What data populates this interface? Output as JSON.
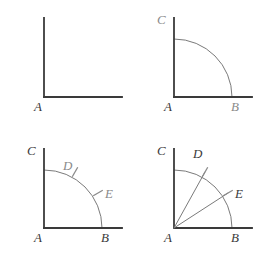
{
  "figure": {
    "type": "geometric-construction",
    "panel_count": 4,
    "layout": "2x2 grid",
    "colors": {
      "background": "#ffffff",
      "ray_stroke": "#3a3a3a",
      "arc_stroke": "#7a7a7a",
      "tick_stroke": "#8a8a8a",
      "label_dark": "#3a3a3a",
      "label_gray": "#8a8a8a"
    },
    "panels": [
      {
        "id": "panel-1",
        "step": 1,
        "description": "A right angle: one vertical ray and one horizontal ray meeting at vertex A",
        "vertex": {
          "name": "A",
          "x": 44,
          "y": 97
        },
        "labels": [
          {
            "name": "A",
            "text": "A",
            "x": 34,
            "y": 100,
            "tone": "dark"
          }
        ],
        "segments": [
          {
            "name": "vertical-ray",
            "x1": 44,
            "y1": 18,
            "x2": 44,
            "y2": 97
          },
          {
            "name": "horizontal-ray",
            "x1": 44,
            "y1": 97,
            "x2": 122,
            "y2": 97
          }
        ],
        "arcs": [],
        "ticks": []
      },
      {
        "id": "panel-2",
        "step": 2,
        "description": "A quarter-circle arc centered at A cuts the vertical ray at C and the horizontal ray at B",
        "vertex": {
          "name": "A",
          "x": 44,
          "y": 97
        },
        "radius": 58,
        "labels": [
          {
            "name": "C",
            "text": "C",
            "x": 27,
            "y": 13,
            "tone": "gray"
          },
          {
            "name": "A",
            "text": "A",
            "x": 34,
            "y": 100,
            "tone": "dark"
          },
          {
            "name": "B",
            "text": "B",
            "x": 101,
            "y": 100,
            "tone": "gray"
          }
        ],
        "segments": [
          {
            "name": "vertical-ray",
            "x1": 44,
            "y1": 18,
            "x2": 44,
            "y2": 97
          },
          {
            "name": "horizontal-ray",
            "x1": 44,
            "y1": 97,
            "x2": 122,
            "y2": 97
          }
        ],
        "arcs": [
          {
            "name": "arc-CB",
            "cx": 44,
            "cy": 97,
            "r": 58,
            "from_deg": 90,
            "to_deg": 0
          }
        ],
        "ticks": []
      },
      {
        "id": "panel-3",
        "step": 3,
        "description": "Two compass marks D and E are struck on the arc between C and B",
        "vertex": {
          "name": "A",
          "x": 44,
          "y": 97
        },
        "radius": 58,
        "labels": [
          {
            "name": "C",
            "text": "C",
            "x": 27,
            "y": 13,
            "tone": "dark"
          },
          {
            "name": "D",
            "text": "D",
            "x": 63,
            "y": 28,
            "tone": "gray"
          },
          {
            "name": "E",
            "text": "E",
            "x": 105,
            "y": 56,
            "tone": "gray"
          },
          {
            "name": "A",
            "text": "A",
            "x": 34,
            "y": 100,
            "tone": "dark"
          },
          {
            "name": "B",
            "text": "B",
            "x": 101,
            "y": 100,
            "tone": "dark"
          }
        ],
        "segments": [
          {
            "name": "vertical-ray",
            "x1": 44,
            "y1": 18,
            "x2": 44,
            "y2": 97
          },
          {
            "name": "horizontal-ray",
            "x1": 44,
            "y1": 97,
            "x2": 122,
            "y2": 97
          }
        ],
        "arcs": [
          {
            "name": "arc-CB",
            "cx": 44,
            "cy": 97,
            "r": 58,
            "from_deg": 90,
            "to_deg": 0
          }
        ],
        "ticks": [
          {
            "name": "tick-D",
            "cx": 75,
            "cy": 41,
            "angle_deg": 60
          },
          {
            "name": "tick-E",
            "cx": 98,
            "cy": 62,
            "angle_deg": 30
          }
        ]
      },
      {
        "id": "panel-4",
        "step": 4,
        "description": "Rays are drawn from vertex A through the marks D and E, dividing the right angle into three equal parts",
        "vertex": {
          "name": "A",
          "x": 44,
          "y": 97
        },
        "radius": 58,
        "labels": [
          {
            "name": "C",
            "text": "C",
            "x": 27,
            "y": 13,
            "tone": "dark"
          },
          {
            "name": "D",
            "text": "D",
            "x": 63,
            "y": 16,
            "tone": "dark"
          },
          {
            "name": "E",
            "text": "E",
            "x": 105,
            "y": 56,
            "tone": "dark"
          },
          {
            "name": "A",
            "text": "A",
            "x": 34,
            "y": 100,
            "tone": "dark"
          },
          {
            "name": "B",
            "text": "B",
            "x": 101,
            "y": 100,
            "tone": "dark"
          }
        ],
        "segments": [
          {
            "name": "vertical-ray",
            "x1": 44,
            "y1": 18,
            "x2": 44,
            "y2": 97
          },
          {
            "name": "horizontal-ray",
            "x1": 44,
            "y1": 97,
            "x2": 122,
            "y2": 97
          },
          {
            "name": "ray-AD",
            "x1": 44,
            "y1": 97,
            "x2": 75,
            "y2": 41
          },
          {
            "name": "ray-AE",
            "x1": 44,
            "y1": 97,
            "x2": 98,
            "y2": 62
          }
        ],
        "arcs": [
          {
            "name": "arc-CB",
            "cx": 44,
            "cy": 97,
            "r": 58,
            "from_deg": 90,
            "to_deg": 0
          }
        ],
        "ticks": [
          {
            "name": "tick-D",
            "cx": 75,
            "cy": 41,
            "angle_deg": 60
          },
          {
            "name": "tick-E",
            "cx": 98,
            "cy": 62,
            "angle_deg": 30
          }
        ]
      }
    ]
  }
}
